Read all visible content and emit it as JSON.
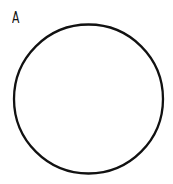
{
  "diagram": {
    "label": "A",
    "shape": {
      "type": "circle",
      "cx": 88.5,
      "cy": 99,
      "r": 74.5,
      "stroke": "#111111",
      "stroke_width": 2.3,
      "fill": "none"
    }
  }
}
